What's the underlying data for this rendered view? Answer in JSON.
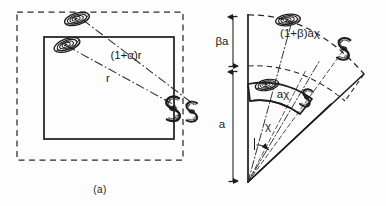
{
  "figure": {
    "panels": [
      {
        "id": "a",
        "caption": "(a)",
        "kind": "cartesian-box",
        "labels": [
          {
            "name": "outer-radius-label",
            "text": "(1+α)r"
          },
          {
            "name": "inner-radius-label",
            "text": "r"
          }
        ],
        "objects": [
          {
            "name": "galaxy-face-on-outer",
            "type": "face-on-spiral"
          },
          {
            "name": "galaxy-face-on-inner",
            "type": "face-on-spiral"
          },
          {
            "name": "galaxy-edge-on-inner",
            "type": "edge-on-spiral"
          },
          {
            "name": "galaxy-edge-on-outer",
            "type": "edge-on-spiral"
          }
        ]
      },
      {
        "id": "b",
        "caption": "",
        "kind": "polar-wedge",
        "labels": [
          {
            "name": "outer-arc-label",
            "text": "(1+β)aχ"
          },
          {
            "name": "inner-wedge-label",
            "text": "aχ"
          },
          {
            "name": "angle-label",
            "text": "χ"
          },
          {
            "name": "radial-outer-dimension-label",
            "text": "βa"
          },
          {
            "name": "radial-inner-dimension-label",
            "text": "a"
          }
        ],
        "objects": [
          {
            "name": "galaxy-face-on-arc",
            "type": "face-on-spiral"
          },
          {
            "name": "galaxy-edge-on-arc",
            "type": "edge-on-spiral"
          },
          {
            "name": "galaxy-face-on-wedge",
            "type": "face-on-spiral"
          },
          {
            "name": "galaxy-edge-on-wedge",
            "type": "edge-on-spiral"
          }
        ]
      }
    ],
    "colors": {
      "ink": "#1a1a1a",
      "line": "#2a2a2a",
      "background": "#fdfdfd"
    }
  }
}
